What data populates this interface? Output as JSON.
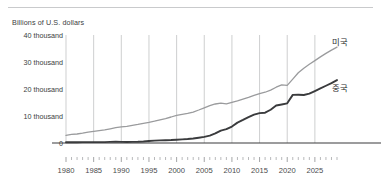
{
  "figure": {
    "subtitle": "Billions of U.S. dollars",
    "has_top_rule": true,
    "background": "#ffffff"
  },
  "chart_data": {
    "type": "line",
    "title": "",
    "subtitle": "Billions of U.S. dollars",
    "xlabel": "",
    "ylabel": "Billions of U.S. dollars",
    "xlim": [
      1980,
      2029
    ],
    "ylim": [
      0,
      40000
    ],
    "grid": "vertical-major-only",
    "legend_position": "right-inline",
    "y_ticks": [
      0,
      10000,
      20000,
      30000,
      40000
    ],
    "y_tick_labels": [
      "0",
      "10 thousand",
      "20 thousand",
      "30 thousand",
      "40 thousand"
    ],
    "x_ticks_major": [
      1980,
      1985,
      1990,
      1995,
      2000,
      2005,
      2010,
      2015,
      2020,
      2025
    ],
    "x_tick_labels": [
      "1980",
      "1985",
      "1990",
      "1995",
      "2000",
      "2005",
      "2010",
      "2015",
      "2020",
      "2025"
    ],
    "x_minor_tick_step": 1,
    "x": [
      1980,
      1981,
      1982,
      1983,
      1984,
      1985,
      1986,
      1987,
      1988,
      1989,
      1990,
      1991,
      1992,
      1993,
      1994,
      1995,
      1996,
      1997,
      1998,
      1999,
      2000,
      2001,
      2002,
      2003,
      2004,
      2005,
      2006,
      2007,
      2008,
      2009,
      2010,
      2011,
      2012,
      2013,
      2014,
      2015,
      2016,
      2017,
      2018,
      2019,
      2020,
      2021,
      2022,
      2023,
      2024,
      2025,
      2026,
      2027,
      2028,
      2029
    ],
    "series": [
      {
        "name": "미국",
        "label": "미국",
        "color": "#9a9b9d",
        "width": 1.3,
        "label_x": 2026,
        "label_y": 37500,
        "values": [
          2860,
          3210,
          3340,
          3640,
          4040,
          4340,
          4580,
          4860,
          5250,
          5660,
          5960,
          6160,
          6520,
          6860,
          7290,
          7640,
          8070,
          8580,
          9060,
          9630,
          10250,
          10580,
          10940,
          11460,
          12220,
          13040,
          13810,
          14450,
          14770,
          14480,
          15050,
          15600,
          16250,
          16880,
          17610,
          18300,
          18800,
          19610,
          20660,
          21540,
          21350,
          23680,
          26010,
          27720,
          29170,
          30510,
          31900,
          33200,
          34400,
          35500
        ]
      },
      {
        "name": "중국",
        "label": "중국",
        "color": "#3a3b3d",
        "width": 1.9,
        "label_x": 2026,
        "label_y": 20500,
        "values": [
          305,
          290,
          285,
          310,
          315,
          315,
          310,
          330,
          410,
          460,
          400,
          390,
          430,
          460,
          580,
          760,
          890,
          980,
          1030,
          1090,
          1210,
          1340,
          1470,
          1660,
          1960,
          2290,
          2750,
          3550,
          4590,
          5110,
          6090,
          7550,
          8530,
          9570,
          10480,
          11060,
          11230,
          12310,
          13890,
          14280,
          14690,
          17820,
          17880,
          17790,
          18270,
          19230,
          20200,
          21200,
          22200,
          23300
        ]
      }
    ]
  }
}
